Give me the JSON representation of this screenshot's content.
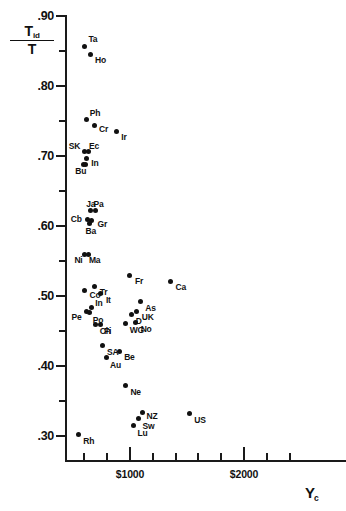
{
  "chart_data": {
    "type": "scatter",
    "title": "",
    "xlabel": "Y_c",
    "ylabel": "T_id / T",
    "xlim": [
      430,
      2550
    ],
    "ylim": [
      0.275,
      0.9
    ],
    "grid": false,
    "legend": "none",
    "y_ticks_major": [
      {
        "value": 0.9,
        "label": ".90"
      },
      {
        "value": 0.8,
        "label": ".80"
      },
      {
        "value": 0.7,
        "label": ".70"
      },
      {
        "value": 0.6,
        "label": ".60"
      },
      {
        "value": 0.5,
        "label": ".50"
      },
      {
        "value": 0.4,
        "label": ".40"
      },
      {
        "value": 0.3,
        "label": ".30"
      }
    ],
    "y_ticks_minor": [
      0.85,
      0.75,
      0.65,
      0.55,
      0.45,
      0.35
    ],
    "x_ticks_major": [
      {
        "value": 1000,
        "label": "$1000"
      },
      {
        "value": 2000,
        "label": "$2000"
      }
    ],
    "x_ticks_minor": [
      600,
      800,
      1200,
      1400,
      1600,
      1800,
      2200,
      2400
    ],
    "points": [
      {
        "label": "Ta",
        "x": 600,
        "y": 0.857,
        "lx": 4,
        "ly": -11
      },
      {
        "label": "Ho",
        "x": 650,
        "y": 0.845,
        "lx": 5,
        "ly": 1
      },
      {
        "label": "Ph",
        "x": 620,
        "y": 0.752,
        "lx": 3,
        "ly": -11
      },
      {
        "label": "Cr",
        "x": 685,
        "y": 0.744,
        "lx": 5,
        "ly": 0
      },
      {
        "label": "Ir",
        "x": 880,
        "y": 0.735,
        "lx": 5,
        "ly": 1
      },
      {
        "label": "SK",
        "x": 603,
        "y": 0.706,
        "lx": -16,
        "ly": -10
      },
      {
        "label": "Ec",
        "x": 640,
        "y": 0.706,
        "lx": 0,
        "ly": -10
      },
      {
        "label": "In",
        "x": 617,
        "y": 0.697,
        "lx": 5,
        "ly": 1
      },
      {
        "label": "Bu",
        "x": 590,
        "y": 0.688,
        "lx": -8,
        "ly": 3
      },
      {
        "label": "",
        "x": 608,
        "y": 0.688,
        "lx": 0,
        "ly": 0
      },
      {
        "label": "Ja",
        "x": 652,
        "y": 0.622,
        "lx": -4,
        "ly": -11
      },
      {
        "label": "Pa",
        "x": 697,
        "y": 0.622,
        "lx": -2,
        "ly": -11
      },
      {
        "label": "Cb",
        "x": 630,
        "y": 0.61,
        "lx": -17,
        "ly": -4
      },
      {
        "label": "Gr",
        "x": 663,
        "y": 0.608,
        "lx": 6,
        "ly": 0
      },
      {
        "label": "Ba",
        "x": 645,
        "y": 0.604,
        "lx": -4,
        "ly": 4
      },
      {
        "label": "Ni",
        "x": 600,
        "y": 0.56,
        "lx": -10,
        "ly": 2
      },
      {
        "label": "Ma",
        "x": 640,
        "y": 0.56,
        "lx": 0,
        "ly": 2
      },
      {
        "label": "Co",
        "x": 602,
        "y": 0.508,
        "lx": 5,
        "ly": 1
      },
      {
        "label": "Tr",
        "x": 690,
        "y": 0.513,
        "lx": 5,
        "ly": 1
      },
      {
        "label": "It",
        "x": 745,
        "y": 0.503,
        "lx": 5,
        "ly": 2
      },
      {
        "label": "In",
        "x": 660,
        "y": 0.484,
        "lx": 4,
        "ly": -8
      },
      {
        "label": "Pe",
        "x": 618,
        "y": 0.478,
        "lx": -15,
        "ly": 2
      },
      {
        "label": "Po",
        "x": 648,
        "y": 0.476,
        "lx": 3,
        "ly": 3
      },
      {
        "label": "Ch",
        "x": 700,
        "y": 0.459,
        "lx": 4,
        "ly": 2
      },
      {
        "label": "Fi",
        "x": 738,
        "y": 0.459,
        "lx": 4,
        "ly": 2
      },
      {
        "label": "Fr",
        "x": 1000,
        "y": 0.53,
        "lx": 5,
        "ly": 2
      },
      {
        "label": "Ca",
        "x": 1355,
        "y": 0.521,
        "lx": 5,
        "ly": 2
      },
      {
        "label": "As",
        "x": 1090,
        "y": 0.492,
        "lx": 5,
        "ly": 2
      },
      {
        "label": "UK",
        "x": 1060,
        "y": 0.478,
        "lx": 5,
        "ly": 2
      },
      {
        "label": "D",
        "x": 1015,
        "y": 0.474,
        "lx": 4,
        "ly": 3
      },
      {
        "label": "No",
        "x": 1050,
        "y": 0.462,
        "lx": 5,
        "ly": 2
      },
      {
        "label": "WG",
        "x": 962,
        "y": 0.461,
        "lx": 4,
        "ly": 3
      },
      {
        "label": "SA",
        "x": 755,
        "y": 0.429,
        "lx": 5,
        "ly": 2
      },
      {
        "label": "Be",
        "x": 905,
        "y": 0.421,
        "lx": 5,
        "ly": 2
      },
      {
        "label": "Au",
        "x": 790,
        "y": 0.412,
        "lx": 4,
        "ly": 3
      },
      {
        "label": "Ne",
        "x": 960,
        "y": 0.372,
        "lx": 5,
        "ly": 2
      },
      {
        "label": "NZ",
        "x": 1110,
        "y": 0.334,
        "lx": 4,
        "ly": 0
      },
      {
        "label": "US",
        "x": 1520,
        "y": 0.332,
        "lx": 5,
        "ly": 2
      },
      {
        "label": "Sw",
        "x": 1075,
        "y": 0.325,
        "lx": 4,
        "ly": 3
      },
      {
        "label": "Lu",
        "x": 1030,
        "y": 0.315,
        "lx": 4,
        "ly": 3
      },
      {
        "label": "Rh",
        "x": 547,
        "y": 0.302,
        "lx": 5,
        "ly": 2
      }
    ]
  },
  "y_axis_title": {
    "numerator": "T",
    "numerator_sub": "id",
    "denominator": "T"
  },
  "x_axis_title": {
    "main": "Y",
    "sub": "c"
  }
}
